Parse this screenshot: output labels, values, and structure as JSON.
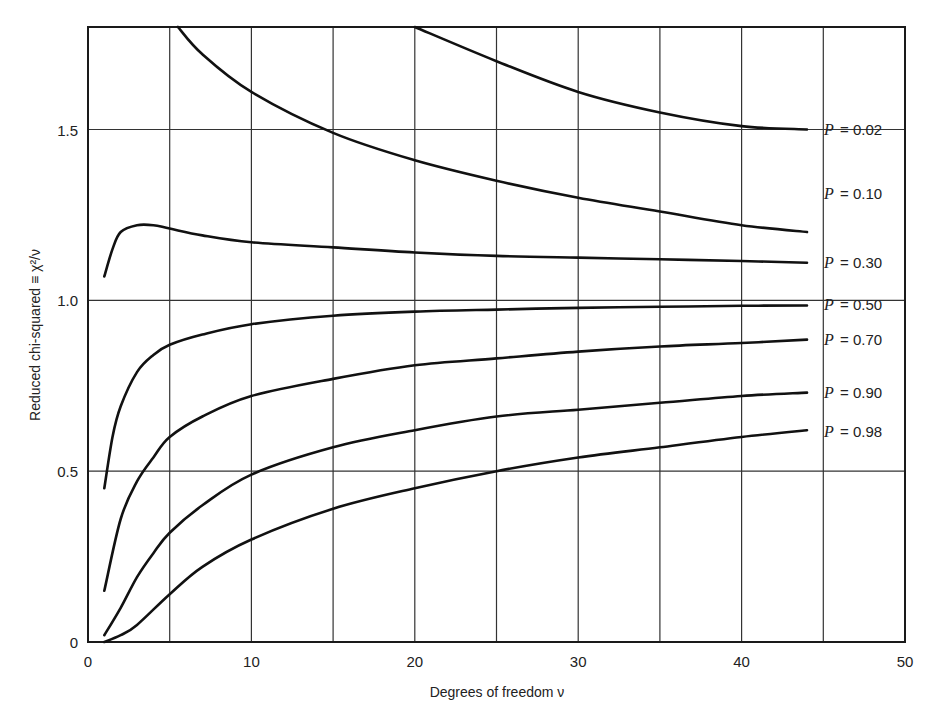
{
  "chart_data": {
    "type": "line",
    "title": "",
    "xlabel": "Degrees of freedom ν",
    "ylabel": "Reduced chi-squared ≡ χ²/ν",
    "xlim": [
      0,
      50
    ],
    "ylim": [
      0,
      1.8
    ],
    "x_ticks": [
      "0",
      "10",
      "20",
      "30",
      "40",
      "50"
    ],
    "y_ticks": [
      "0",
      "0.5",
      "1.0",
      "1.5"
    ],
    "grid": {
      "vertical_every": 5,
      "horizontal_at": [
        0.5,
        1.0,
        1.5
      ]
    },
    "legend_position": "right inline labels",
    "series": [
      {
        "name": "P = 0.02",
        "label_P": "P",
        "label_val": "= 0.02",
        "x": [
          5.5,
          7,
          10,
          15,
          20,
          25,
          30,
          35,
          40,
          44
        ],
        "y": [
          1.8,
          1.72,
          1.61,
          1.49,
          1.41,
          1.35,
          1.3,
          1.26,
          1.22,
          1.2
        ]
      },
      {
        "name": "P = 0.10",
        "label_P": "P",
        "label_val": "= 0.10",
        "x": [
          20,
          25,
          30,
          35,
          40,
          44
        ],
        "y": [
          1.8,
          1.7,
          1.61,
          1.55,
          1.51,
          1.5
        ]
      },
      {
        "name": "P = 0.30",
        "label_P": "P",
        "label_val": "= 0.30",
        "x": [
          1,
          1.5,
          2,
          3,
          4,
          5,
          7,
          10,
          15,
          20,
          25,
          30,
          35,
          40,
          44
        ],
        "y": [
          1.07,
          1.15,
          1.2,
          1.22,
          1.22,
          1.21,
          1.19,
          1.17,
          1.155,
          1.14,
          1.13,
          1.125,
          1.12,
          1.115,
          1.11
        ]
      },
      {
        "name": "P = 0.50",
        "label_P": "P",
        "label_val": "= 0.50",
        "x": [
          1,
          1.5,
          2,
          3,
          4,
          5,
          7,
          10,
          15,
          20,
          25,
          30,
          35,
          40,
          44
        ],
        "y": [
          0.45,
          0.6,
          0.69,
          0.79,
          0.84,
          0.87,
          0.9,
          0.93,
          0.955,
          0.967,
          0.973,
          0.978,
          0.981,
          0.984,
          0.985
        ]
      },
      {
        "name": "P = 0.70",
        "label_P": "P",
        "label_val": "= 0.70",
        "x": [
          1,
          2,
          3,
          4,
          5,
          7,
          10,
          15,
          20,
          25,
          30,
          35,
          40,
          44
        ],
        "y": [
          0.15,
          0.36,
          0.47,
          0.54,
          0.6,
          0.66,
          0.72,
          0.77,
          0.81,
          0.83,
          0.85,
          0.865,
          0.875,
          0.885
        ]
      },
      {
        "name": "P = 0.90",
        "label_P": "P",
        "label_val": "= 0.90",
        "x": [
          1,
          2,
          3,
          4,
          5,
          7,
          10,
          15,
          20,
          25,
          30,
          35,
          40,
          44
        ],
        "y": [
          0.02,
          0.1,
          0.19,
          0.26,
          0.32,
          0.4,
          0.49,
          0.57,
          0.62,
          0.66,
          0.68,
          0.7,
          0.72,
          0.73
        ]
      },
      {
        "name": "P = 0.98",
        "label_P": "P",
        "label_val": "= 0.98",
        "x": [
          1,
          2,
          3,
          5,
          7,
          10,
          15,
          20,
          25,
          30,
          35,
          40,
          44
        ],
        "y": [
          0.0,
          0.02,
          0.05,
          0.14,
          0.22,
          0.3,
          0.39,
          0.45,
          0.5,
          0.54,
          0.57,
          0.6,
          0.62
        ]
      }
    ]
  },
  "label_positions_y": [
    1.5,
    1.31,
    1.11,
    0.985,
    0.885,
    0.73,
    0.615
  ]
}
